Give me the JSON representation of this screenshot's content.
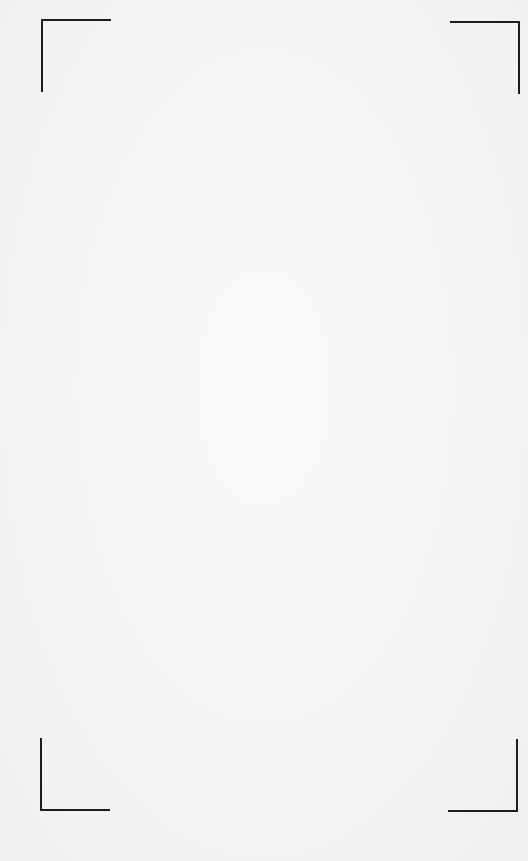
{
  "viewfinder": {
    "type": "scan-frame",
    "corners": [
      {
        "position": "top-left",
        "icon": "corner-bracket-top-left-icon"
      },
      {
        "position": "top-right",
        "icon": "corner-bracket-top-right-icon"
      },
      {
        "position": "bottom-left",
        "icon": "corner-bracket-bottom-left-icon"
      },
      {
        "position": "bottom-right",
        "icon": "corner-bracket-bottom-right-icon"
      }
    ],
    "colors": {
      "background": "#f5f5f5",
      "bracket": "#1e1e1e"
    }
  }
}
